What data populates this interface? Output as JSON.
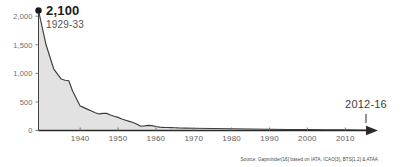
{
  "chart_data": {
    "type": "area",
    "title": "",
    "subtitle": "",
    "xlabel": "",
    "ylabel": "",
    "xlim": [
      1929,
      2016
    ],
    "ylim": [
      0,
      2100
    ],
    "grid": false,
    "legend": "none",
    "series": [
      {
        "name": "Deaths per 10 billion passenger miles",
        "x": [
          1929,
          1931,
          1933,
          1935,
          1936,
          1937,
          1938,
          1939,
          1940,
          1941,
          1942,
          1943,
          1944,
          1945,
          1946,
          1947,
          1948,
          1949,
          1950,
          1951,
          1952,
          1953,
          1954,
          1955,
          1956,
          1957,
          1958,
          1959,
          1960,
          1961,
          1962,
          1963,
          1964,
          1965,
          1966,
          1968,
          1970,
          1975,
          1980,
          1985,
          1990,
          1995,
          2000,
          2005,
          2010,
          2014,
          2016
        ],
        "y": [
          2100,
          1500,
          1080,
          900,
          880,
          870,
          690,
          560,
          430,
          400,
          370,
          340,
          310,
          290,
          300,
          300,
          270,
          250,
          230,
          200,
          180,
          160,
          140,
          110,
          75,
          80,
          90,
          85,
          70,
          60,
          55,
          52,
          50,
          48,
          45,
          42,
          40,
          35,
          30,
          26,
          22,
          18,
          15,
          12,
          10,
          8,
          8
        ]
      }
    ],
    "y_ticks": [
      0,
      500,
      1000,
      1500,
      2000
    ],
    "y_tick_labels": [
      "0",
      "500",
      "1,000",
      "1,500",
      "2,000"
    ],
    "x_ticks": [
      1940,
      1950,
      1960,
      1970,
      1980,
      1990,
      2000,
      2010
    ],
    "x_tick_labels": [
      "1940",
      "1950",
      "1960",
      "1970",
      "1980",
      "1990",
      "2000",
      "2010"
    ],
    "annotations": [
      {
        "name": "start-callout",
        "value": "2,100",
        "period": "1929-33",
        "x": 1929,
        "y": 2100
      },
      {
        "name": "end-callout",
        "value": "",
        "period": "2012-16",
        "x": 2014,
        "y": 0
      }
    ],
    "colors": {
      "area_fill": "#e0e0e0",
      "line_stroke": "#3d3d3d",
      "axis": "#2b2b2b",
      "tick_text": "#6e6e6e",
      "marker": "#1a1a1a"
    }
  },
  "source": {
    "text": "Source: Gapminder[16] based on IATA, ICAO[3], BTS[1,2] & ATAA"
  }
}
